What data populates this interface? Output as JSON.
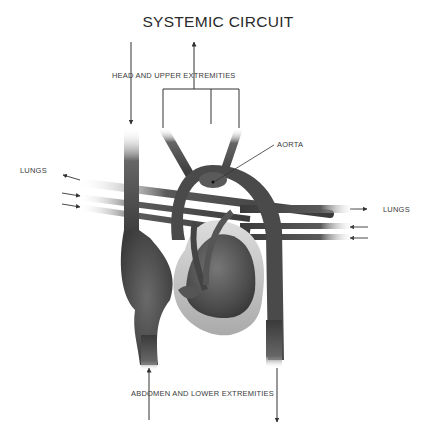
{
  "diagram": {
    "title": "SYSTEMIC CIRCUIT",
    "labels": {
      "head_upper": "HEAD AND UPPER EXTREMITIES",
      "aorta": "AORTA",
      "lungs_left": "LUNGS",
      "lungs_right": "LUNGS",
      "abdomen_lower": "ABDOMEN AND LOWER EXTREMITIES"
    },
    "colors": {
      "vessel_dark": "#3c3c3c",
      "vessel_mid": "#707070",
      "vessel_light": "#bdbdbd",
      "line": "#333333",
      "text": "#3a3a3a"
    }
  }
}
